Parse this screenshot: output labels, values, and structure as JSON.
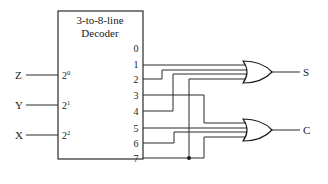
{
  "diagram": {
    "type": "logic-circuit",
    "decoder": {
      "title_line1": "3-to-8-line",
      "title_line2": "Decoder",
      "inputs": [
        {
          "signal": "Z",
          "weight_base": "2",
          "weight_exp": "0"
        },
        {
          "signal": "Y",
          "weight_base": "2",
          "weight_exp": "1"
        },
        {
          "signal": "X",
          "weight_base": "2",
          "weight_exp": "2"
        }
      ],
      "outputs": [
        "0",
        "1",
        "2",
        "3",
        "4",
        "5",
        "6",
        "7"
      ]
    },
    "gates": [
      {
        "type": "OR",
        "output": "S",
        "inputs": [
          "1",
          "2",
          "4",
          "7"
        ]
      },
      {
        "type": "OR",
        "output": "C",
        "inputs": [
          "3",
          "5",
          "6",
          "7"
        ]
      }
    ]
  }
}
